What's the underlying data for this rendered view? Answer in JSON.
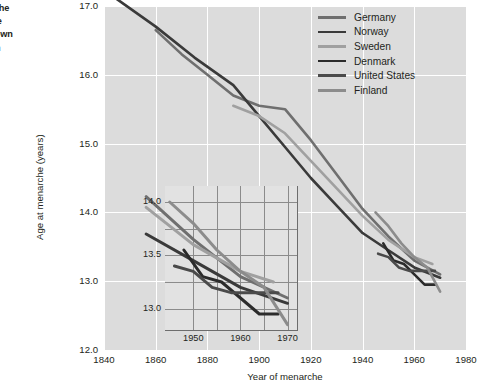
{
  "caption": {
    "line1": "menarche",
    "line2": "over the",
    "line3": "e is known",
    "line4": "oted from"
  },
  "chart_data": {
    "type": "line",
    "title": "",
    "xlabel": "Year of menarche",
    "ylabel": "Age at menarche (years)",
    "xlim": [
      1840,
      1980
    ],
    "ylim": [
      12.0,
      17.0
    ],
    "xticks": [
      1840,
      1860,
      1880,
      1900,
      1920,
      1940,
      1960,
      1980
    ],
    "yticks": [
      "12.0",
      "13.0",
      "14.0",
      "15.0",
      "16.0",
      "17.0"
    ],
    "grid": true,
    "legend_position": "top-right",
    "colors": {
      "germany": "#6f6f6f",
      "norway": "#3a3a3a",
      "sweden": "#a0a0a0",
      "denmark": "#2b2b2b",
      "united_states": "#4a4a4a",
      "finland": "#8c8c8c"
    },
    "series": [
      {
        "name": "Germany",
        "color": "#6f6f6f",
        "x": [
          1860,
          1870,
          1880,
          1890,
          1900,
          1910,
          1920,
          1930,
          1940,
          1950,
          1960,
          1970
        ],
        "y": [
          16.65,
          16.3,
          16.0,
          15.7,
          15.55,
          15.5,
          15.05,
          14.55,
          14.05,
          13.65,
          13.3,
          13.1
        ]
      },
      {
        "name": "Norway",
        "color": "#3a3a3a",
        "x": [
          1845,
          1860,
          1875,
          1890,
          1900,
          1910,
          1920,
          1930,
          1940,
          1950,
          1960,
          1970
        ],
        "y": [
          17.1,
          16.7,
          16.25,
          15.85,
          15.4,
          14.95,
          14.5,
          14.1,
          13.7,
          13.45,
          13.2,
          13.05
        ]
      },
      {
        "name": "Sweden",
        "color": "#a0a0a0",
        "x": [
          1890,
          1900,
          1910,
          1920,
          1930,
          1940,
          1950,
          1960,
          1967
        ],
        "y": [
          15.55,
          15.4,
          15.15,
          14.75,
          14.35,
          13.95,
          13.6,
          13.35,
          13.25
        ]
      },
      {
        "name": "Denmark",
        "color": "#2b2b2b",
        "x": [
          1948,
          1952,
          1956,
          1960,
          1964,
          1968
        ],
        "y": [
          13.55,
          13.3,
          13.25,
          13.1,
          12.95,
          12.95
        ]
      },
      {
        "name": "United States",
        "color": "#4a4a4a",
        "x": [
          1946,
          1950,
          1954,
          1958,
          1962,
          1968
        ],
        "y": [
          13.4,
          13.35,
          13.2,
          13.15,
          13.15,
          13.15
        ]
      },
      {
        "name": "Finland",
        "color": "#8c8c8c",
        "x": [
          1945,
          1950,
          1955,
          1960,
          1965,
          1970
        ],
        "y": [
          14.0,
          13.8,
          13.55,
          13.35,
          13.2,
          12.85
        ]
      }
    ],
    "inset": {
      "xlim": [
        1944,
        1972
      ],
      "ylim": [
        12.8,
        14.15
      ],
      "xticks": [
        1950,
        1960,
        1970
      ],
      "yticks": [
        "13.0",
        "13.5",
        "14.0"
      ],
      "grid": true
    }
  },
  "legend": {
    "items": [
      {
        "label": "Germany",
        "color": "#6f6f6f"
      },
      {
        "label": "Norway",
        "color": "#3a3a3a"
      },
      {
        "label": "Sweden",
        "color": "#a0a0a0"
      },
      {
        "label": "Denmark",
        "color": "#2b2b2b"
      },
      {
        "label": "United States",
        "color": "#4a4a4a"
      },
      {
        "label": "Finland",
        "color": "#8c8c8c"
      }
    ]
  }
}
